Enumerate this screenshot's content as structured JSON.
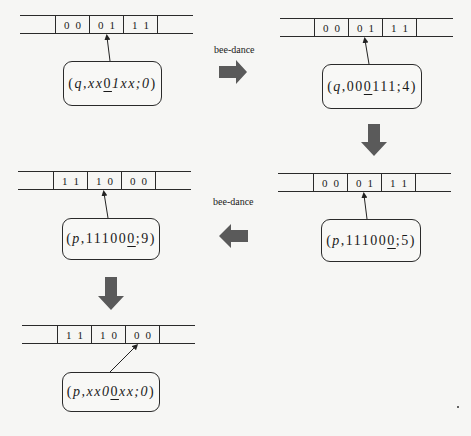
{
  "diagram": {
    "transition_label": "bee-dance",
    "colors": {
      "line": "#2a2a2a",
      "arrow_fill": "#5a5a5a",
      "background": "#f6f6f4"
    },
    "panels": [
      {
        "id": "top-left",
        "tape": [
          "0",
          "0",
          "0",
          "1",
          "1",
          "1"
        ],
        "state": {
          "name": "q",
          "prefix": ",xx",
          "underlined": "0",
          "suffix": "1xx;0"
        },
        "state_text": "(q,xx0̱ 1xx;0)"
      },
      {
        "id": "top-right",
        "tape": [
          "0",
          "0",
          "0",
          "1",
          "1",
          "1"
        ],
        "state": {
          "name": "q",
          "prefix": ",00",
          "underlined": "0",
          "suffix": "111;4"
        },
        "state_text": "(q,000̱111;4)"
      },
      {
        "id": "middle-right",
        "tape": [
          "0",
          "0",
          "0",
          "1",
          "1",
          "1"
        ],
        "state": {
          "name": "p",
          "prefix": ",11100",
          "underlined": "0",
          "suffix": ";5"
        },
        "state_text": "(p,111000̱;5)"
      },
      {
        "id": "middle-left",
        "tape": [
          "1",
          "1",
          "1",
          "0",
          "0",
          "0"
        ],
        "state": {
          "name": "p",
          "prefix": ",11100",
          "underlined": "0",
          "suffix": ";9"
        },
        "state_text": "(p,111000̱;9)"
      },
      {
        "id": "bottom-left",
        "tape": [
          "1",
          "1",
          "1",
          "0",
          "0",
          "0"
        ],
        "state": {
          "name": "p",
          "prefix": ",xx0",
          "underlined": "0",
          "suffix": "xx;0"
        },
        "state_text": "(p,xx00̱xx;0)"
      }
    ],
    "transitions": [
      {
        "from": "top-left",
        "to": "top-right",
        "direction": "right",
        "label": "bee-dance"
      },
      {
        "from": "top-right",
        "to": "middle-right",
        "direction": "down",
        "label": ""
      },
      {
        "from": "middle-right",
        "to": "middle-left",
        "direction": "left",
        "label": "bee-dance"
      },
      {
        "from": "middle-left",
        "to": "bottom-left",
        "direction": "down",
        "label": ""
      }
    ]
  }
}
